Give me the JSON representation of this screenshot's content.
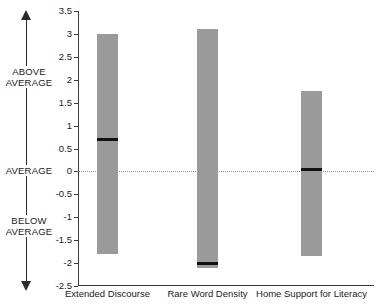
{
  "chart_data": {
    "type": "bar",
    "title": "",
    "subtitle": "",
    "xlabel": "",
    "ylabel": "",
    "ylim": [
      -2.5,
      3.5
    ],
    "yticks": [
      3.5,
      3,
      2.5,
      2,
      1.5,
      1,
      0.5,
      0,
      -0.5,
      -1,
      -1.5,
      -2,
      -2.5
    ],
    "ytick_labels": [
      "3.5",
      "3",
      "2.5",
      "2",
      "1.5",
      "1",
      "0.5",
      "0",
      "-0.5",
      "-1",
      "-1.5",
      "-2",
      "-2.5"
    ],
    "grid": false,
    "legend": "none",
    "zero_reference_line": 0,
    "categories": [
      "Extended Discourse",
      "Rare Word Density",
      "Home Support for Literacy"
    ],
    "series": [
      {
        "name": "Range",
        "type": "range-bar",
        "high": [
          3.0,
          3.1,
          1.75
        ],
        "low": [
          -1.8,
          -2.1,
          -1.85
        ]
      },
      {
        "name": "Median marker",
        "type": "marker",
        "values": [
          0.7,
          -2.0,
          0.05
        ]
      }
    ],
    "annotations": [
      {
        "text": "ABOVE AVERAGE",
        "region": "above-zero"
      },
      {
        "text": "AVERAGE",
        "region": "zero"
      },
      {
        "text": "BELOW AVERAGE",
        "region": "below-zero"
      }
    ],
    "colors": {
      "bar": "#9a9a9a",
      "marker": "#111111",
      "axis": "#3a3a3a",
      "zero_line": "#8e8e8e",
      "text": "#1a1a1a",
      "background": "#ffffff"
    }
  },
  "annotation_axis": {
    "above_label_line1": "ABOVE",
    "above_label_line2": "AVERAGE",
    "average_label": "AVERAGE",
    "below_label_line1": "BELOW",
    "below_label_line2": "AVERAGE"
  }
}
